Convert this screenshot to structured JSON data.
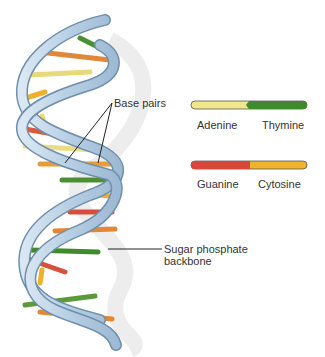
{
  "labels": {
    "base_pairs": "Base pairs",
    "sugar_line1": "Sugar phosphate",
    "sugar_line2": "backbone"
  },
  "legend": [
    {
      "left": "Adenine",
      "right": "Thymine",
      "left_color": "#f2e68a",
      "right_color": "#3f8a2a"
    },
    {
      "left": "Guanine",
      "right": "Cytosine",
      "left_color": "#d9463c",
      "right_color": "#f0b32a"
    }
  ],
  "colors": {
    "backbone": "#b9d3e8",
    "backbone_edge": "#6f8faa"
  }
}
